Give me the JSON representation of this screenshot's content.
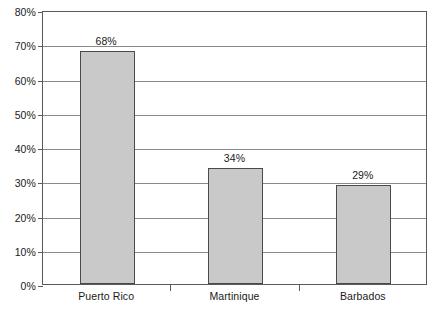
{
  "chart_data": {
    "type": "bar",
    "title": "",
    "subtitle": "",
    "xlabel": "",
    "ylabel": "",
    "categories": [
      "Puerto Rico",
      "Martinique",
      "Barbados"
    ],
    "values": [
      68,
      34,
      29
    ],
    "value_labels": [
      "68%",
      "34%",
      "29%"
    ],
    "ylim": [
      0,
      80
    ],
    "ytick_values": [
      0,
      10,
      20,
      30,
      40,
      50,
      60,
      70,
      80
    ],
    "ytick_labels": [
      "0%",
      "10%",
      "20%",
      "30%",
      "40%",
      "50%",
      "60%",
      "70%",
      "80%"
    ],
    "grid": true,
    "legend": false,
    "legend_position": "none",
    "bar_fill_color": "#c9c9c9",
    "bar_border_color": "#4a4a4a",
    "grid_color": "#8a8a8a",
    "axis_color": "#5a5a5a",
    "text_color": "#1a1a1a",
    "background_color": "#ffffff"
  }
}
